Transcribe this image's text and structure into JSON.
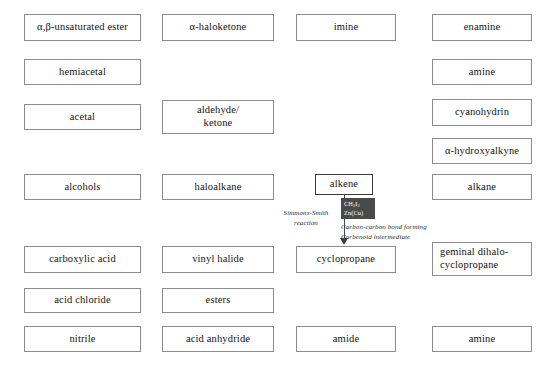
{
  "diagram": {
    "highlighted_node": "alkene",
    "accent_color": "#4a4a4a",
    "box_border_color": "#8c8c8c",
    "nodes": [
      {
        "id": "alpha-beta-unsaturated-ester",
        "label": "α,β-unsaturated ester",
        "x": 24,
        "y": 14,
        "w": 117,
        "h": 27
      },
      {
        "id": "alpha-haloketone",
        "label": "α-haloketone",
        "x": 162,
        "y": 14,
        "w": 112,
        "h": 27
      },
      {
        "id": "imine",
        "label": "imine",
        "x": 296,
        "y": 14,
        "w": 100,
        "h": 27
      },
      {
        "id": "enamine",
        "label": "enamine",
        "x": 432,
        "y": 14,
        "w": 100,
        "h": 27
      },
      {
        "id": "hemiacetal",
        "label": "hemiacetal",
        "x": 24,
        "y": 59,
        "w": 117,
        "h": 26
      },
      {
        "id": "amine-top",
        "label": "amine",
        "x": 432,
        "y": 59,
        "w": 100,
        "h": 26
      },
      {
        "id": "acetal",
        "label": "acetal",
        "x": 24,
        "y": 104,
        "w": 117,
        "h": 26
      },
      {
        "id": "aldehyde-ketone",
        "label": "aldehyde/\nketone",
        "x": 162,
        "y": 100,
        "w": 112,
        "h": 34
      },
      {
        "id": "cyanohydrin",
        "label": "cyanohydrin",
        "x": 432,
        "y": 99,
        "w": 100,
        "h": 27
      },
      {
        "id": "alpha-hydroxyalkyne",
        "label": "α-hydroxyalkyne",
        "x": 432,
        "y": 138,
        "w": 100,
        "h": 26
      },
      {
        "id": "alcohols",
        "label": "alcohols",
        "x": 24,
        "y": 174,
        "w": 117,
        "h": 26
      },
      {
        "id": "haloalkane",
        "label": "haloalkane",
        "x": 162,
        "y": 174,
        "w": 112,
        "h": 26
      },
      {
        "id": "alkene",
        "label": "alkene",
        "x": 315,
        "y": 174,
        "w": 58,
        "h": 21,
        "highlight": true
      },
      {
        "id": "alkane",
        "label": "alkane",
        "x": 432,
        "y": 174,
        "w": 100,
        "h": 26
      },
      {
        "id": "carboxylic-acid",
        "label": "carboxylic acid",
        "x": 24,
        "y": 246,
        "w": 117,
        "h": 27
      },
      {
        "id": "vinyl-halide",
        "label": "vinyl halide",
        "x": 162,
        "y": 246,
        "w": 112,
        "h": 27
      },
      {
        "id": "cyclopropane",
        "label": "cyclopropane",
        "x": 296,
        "y": 246,
        "w": 100,
        "h": 27
      },
      {
        "id": "geminal-dihalocyclopropane",
        "label": "geminal dihalo-\ncyclopropane",
        "x": 432,
        "y": 242,
        "w": 100,
        "h": 34,
        "left_text": true
      },
      {
        "id": "acid-chloride",
        "label": "acid chloride",
        "x": 24,
        "y": 288,
        "w": 117,
        "h": 25
      },
      {
        "id": "esters",
        "label": "esters",
        "x": 162,
        "y": 288,
        "w": 112,
        "h": 25
      },
      {
        "id": "nitrile",
        "label": "nitrile",
        "x": 24,
        "y": 326,
        "w": 117,
        "h": 26
      },
      {
        "id": "acid-anhydride",
        "label": "acid anhydride",
        "x": 162,
        "y": 326,
        "w": 112,
        "h": 26
      },
      {
        "id": "amide",
        "label": "amide",
        "x": 296,
        "y": 326,
        "w": 100,
        "h": 26
      },
      {
        "id": "amine-bottom",
        "label": "amine",
        "x": 432,
        "y": 326,
        "w": 100,
        "h": 26
      }
    ],
    "reaction": {
      "from": "alkene",
      "to": "cyclopropane",
      "name_line1": "Simmons-Smith",
      "name_line2": "reaction",
      "reagent_line1_pre": "CH",
      "reagent_line1_sub1": "2",
      "reagent_line1_mid": "I",
      "reagent_line1_sub2": "2",
      "reagent_line2": "Zn(Cu)",
      "note_line1": "Carbon-carbon bond forming",
      "note_line2": "Carbenoid intermediate"
    }
  }
}
